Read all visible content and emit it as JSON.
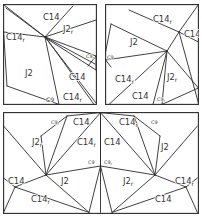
{
  "figure": {
    "background_color": "#ffffff",
    "line_color": "#2b2b2b",
    "label_color": "#333333",
    "panels": [
      {
        "id": "top-left",
        "name": "panel-top-left",
        "x": 3,
        "y": 4,
        "width": 93,
        "height": 100,
        "labels": [
          {
            "text": "C14",
            "sub": "",
            "x": 40,
            "y": 16,
            "size": "n"
          },
          {
            "text": "C14",
            "sub": "r",
            "x": 3,
            "y": 36,
            "size": "n"
          },
          {
            "text": "J2",
            "sub": "r",
            "x": 60,
            "y": 28,
            "size": "n"
          },
          {
            "text": "J2",
            "sub": "",
            "x": 22,
            "y": 72,
            "size": "n"
          },
          {
            "text": "C9",
            "sub": "r",
            "x": 83,
            "y": 54,
            "size": "xs"
          },
          {
            "text": "C14",
            "sub": "",
            "x": 66,
            "y": 76,
            "size": "n"
          },
          {
            "text": "C14",
            "sub": "r",
            "x": 60,
            "y": 96,
            "size": "n"
          },
          {
            "text": "C9",
            "sub": "",
            "x": 43,
            "y": 98,
            "size": "sm"
          }
        ]
      },
      {
        "id": "top-right",
        "name": "panel-top-right",
        "x": 105,
        "y": 4,
        "width": 93,
        "height": 100,
        "labels": [
          {
            "text": "C14",
            "sub": "r",
            "x": 48,
            "y": 18,
            "size": "n"
          },
          {
            "text": "C14",
            "sub": "",
            "x": 79,
            "y": 33,
            "size": "n"
          },
          {
            "text": "J2",
            "sub": "",
            "x": 25,
            "y": 41,
            "size": "n"
          },
          {
            "text": "C9",
            "sub": "",
            "x": 2,
            "y": 55,
            "size": "xs"
          },
          {
            "text": "C14",
            "sub": "r",
            "x": 10,
            "y": 78,
            "size": "n"
          },
          {
            "text": "J2",
            "sub": "r",
            "x": 62,
            "y": 76,
            "size": "n"
          },
          {
            "text": "C14",
            "sub": "",
            "x": 27,
            "y": 95,
            "size": "n"
          },
          {
            "text": "C9",
            "sub": "r",
            "x": 52,
            "y": 97,
            "size": "xs"
          }
        ]
      },
      {
        "id": "bottom",
        "name": "panel-bottom",
        "x": 3,
        "y": 112,
        "width": 196,
        "height": 101,
        "labels": [
          {
            "text": "C9",
            "sub": "r",
            "x": 48,
            "y": 12,
            "size": "xs"
          },
          {
            "text": "C14",
            "sub": "",
            "x": 70,
            "y": 13,
            "size": "n"
          },
          {
            "text": "C14",
            "sub": "r",
            "x": 116,
            "y": 13,
            "size": "n"
          },
          {
            "text": "C9",
            "sub": "",
            "x": 148,
            "y": 12,
            "size": "xs"
          },
          {
            "text": "J2",
            "sub": "r",
            "x": 29,
            "y": 33,
            "size": "n"
          },
          {
            "text": "C14",
            "sub": "r",
            "x": 74,
            "y": 33,
            "size": "n"
          },
          {
            "text": "C14",
            "sub": "",
            "x": 101,
            "y": 33,
            "size": "n"
          },
          {
            "text": "J2",
            "sub": "",
            "x": 158,
            "y": 38,
            "size": "n"
          },
          {
            "text": "C9",
            "sub": "",
            "x": 85,
            "y": 52,
            "size": "xs"
          },
          {
            "text": "C9",
            "sub": "r",
            "x": 101,
            "y": 52,
            "size": "xs"
          },
          {
            "text": "C14",
            "sub": "",
            "x": 5,
            "y": 72,
            "size": "n"
          },
          {
            "text": "J2",
            "sub": "",
            "x": 58,
            "y": 72,
            "size": "n"
          },
          {
            "text": "J2",
            "sub": "r",
            "x": 120,
            "y": 72,
            "size": "n"
          },
          {
            "text": "C14",
            "sub": "r",
            "x": 172,
            "y": 72,
            "size": "n"
          },
          {
            "text": "C14",
            "sub": "r",
            "x": 28,
            "y": 90,
            "size": "n"
          },
          {
            "text": "C14",
            "sub": "",
            "x": 152,
            "y": 90,
            "size": "n"
          }
        ]
      }
    ]
  }
}
